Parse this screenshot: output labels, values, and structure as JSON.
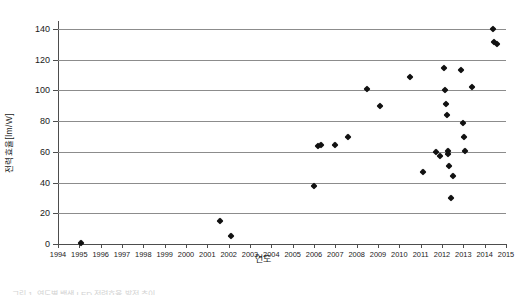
{
  "chart_data": {
    "type": "scatter",
    "title": "",
    "xlabel": "연도",
    "ylabel": "전력효율[lm/W]",
    "xlim": [
      1994,
      2015
    ],
    "ylim": [
      0,
      140
    ],
    "xticks": [
      1994,
      1995,
      1996,
      1997,
      1998,
      1999,
      2000,
      2001,
      2002,
      2003,
      2004,
      2005,
      2006,
      2007,
      2008,
      2009,
      2010,
      2011,
      2012,
      2013,
      2014,
      2015
    ],
    "yticks": [
      0,
      20,
      40,
      60,
      80,
      100,
      120,
      140
    ],
    "grid": "horizontal",
    "legend": "none",
    "marker": "diamond",
    "marker_color": "#111111",
    "gridline_color": "#8c8c8c",
    "axis_color": "#4d4d4d",
    "points": [
      {
        "x": 1995.1,
        "y": 0.6
      },
      {
        "x": 2001.6,
        "y": 15.0
      },
      {
        "x": 2002.1,
        "y": 5.0
      },
      {
        "x": 2006.0,
        "y": 38.0
      },
      {
        "x": 2006.2,
        "y": 63.5
      },
      {
        "x": 2006.35,
        "y": 64.5
      },
      {
        "x": 2007.0,
        "y": 64.5
      },
      {
        "x": 2007.6,
        "y": 70.0
      },
      {
        "x": 2008.5,
        "y": 101.0
      },
      {
        "x": 2009.1,
        "y": 90.0
      },
      {
        "x": 2010.5,
        "y": 109.0
      },
      {
        "x": 2011.1,
        "y": 47.0
      },
      {
        "x": 2011.7,
        "y": 60.0
      },
      {
        "x": 2011.9,
        "y": 57.0
      },
      {
        "x": 2012.1,
        "y": 114.5
      },
      {
        "x": 2012.15,
        "y": 100.5
      },
      {
        "x": 2012.2,
        "y": 91.0
      },
      {
        "x": 2012.25,
        "y": 84.0
      },
      {
        "x": 2012.3,
        "y": 60.5
      },
      {
        "x": 2012.3,
        "y": 58.5
      },
      {
        "x": 2012.35,
        "y": 50.5
      },
      {
        "x": 2012.4,
        "y": 30.0
      },
      {
        "x": 2012.5,
        "y": 44.5
      },
      {
        "x": 2012.9,
        "y": 113.0
      },
      {
        "x": 2013.0,
        "y": 79.0
      },
      {
        "x": 2013.05,
        "y": 70.0
      },
      {
        "x": 2013.1,
        "y": 60.5
      },
      {
        "x": 2013.4,
        "y": 102.0
      },
      {
        "x": 2014.4,
        "y": 140.0
      },
      {
        "x": 2014.45,
        "y": 131.5
      },
      {
        "x": 2014.6,
        "y": 130.5
      }
    ]
  },
  "caption": {
    "text": "그림 1. 연도별 백색 LED 전력효율 발전 추이"
  }
}
